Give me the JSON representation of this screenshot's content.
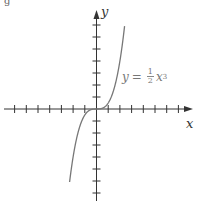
{
  "figure": {
    "corner_label": "g",
    "x_axis_label": "x",
    "y_axis_label": "y",
    "equation": {
      "lhs": "y",
      "equals": "=",
      "numerator": "1",
      "denominator": "2",
      "variable": "x",
      "exponent": "3"
    }
  },
  "colors": {
    "axis": "#333333",
    "curve": "#777777",
    "label": "#777777"
  },
  "chart_data": {
    "type": "line",
    "title": "",
    "xlabel": "x",
    "ylabel": "y",
    "function": "y = (1/2) x^3",
    "legend": [],
    "annotations": [
      "y = ½ x³"
    ],
    "grid": false,
    "xlim": [
      -8,
      8
    ],
    "ylim": [
      -8,
      8
    ],
    "x_ticks": [
      -7,
      -6,
      -5,
      -4,
      -3,
      -2,
      -1,
      1,
      2,
      3,
      4,
      5,
      6,
      7
    ],
    "y_ticks": [
      -7,
      -6,
      -5,
      -4,
      -3,
      -2,
      -1,
      1,
      2,
      3,
      4,
      5,
      6,
      7
    ],
    "series": [
      {
        "name": "y = 1/2 x^3",
        "x": [
          -2.3,
          -2.0,
          -1.5,
          -1.0,
          -0.5,
          0,
          0.5,
          1.0,
          1.5,
          2.0,
          2.4
        ],
        "y": [
          -6.08,
          -4.0,
          -1.69,
          -0.5,
          -0.06,
          0,
          0.06,
          0.5,
          1.69,
          4.0,
          6.91
        ]
      }
    ]
  }
}
